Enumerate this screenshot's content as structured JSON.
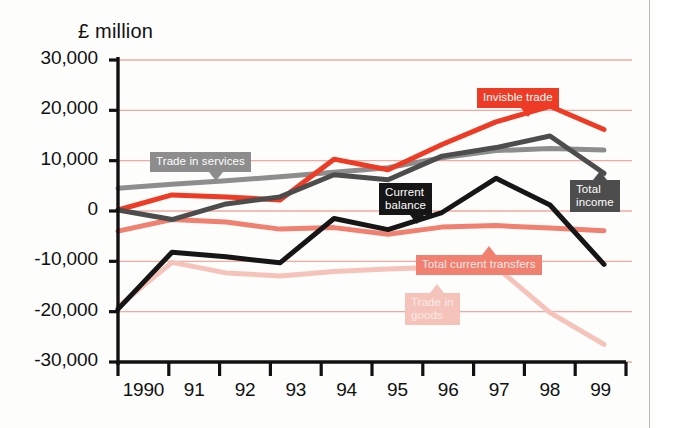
{
  "chart_data": {
    "type": "line",
    "title": "",
    "subtitle": "",
    "ylabel": "£ million",
    "xlabel": "",
    "grid": true,
    "legend_position": "inline-labels",
    "ylim": [
      -30000,
      30000
    ],
    "ytick_labels": [
      "30,000",
      "20,000",
      "10,000",
      "0",
      "-10,000",
      "-20,000",
      "-30,000"
    ],
    "ytick_values": [
      30000,
      20000,
      10000,
      0,
      -10000,
      -20000,
      -30000
    ],
    "categories": [
      "1990",
      "91",
      "92",
      "93",
      "94",
      "95",
      "96",
      "97",
      "98",
      "99"
    ],
    "x": [
      1990,
      1991,
      1992,
      1993,
      1994,
      1995,
      1996,
      1997,
      1998,
      1999
    ],
    "series": [
      {
        "name": "Invisble trade",
        "color": "#ee3b25",
        "width": 5,
        "values": [
          200,
          3200,
          2800,
          2200,
          10300,
          8200,
          13200,
          17700,
          20800,
          16200
        ]
      },
      {
        "name": "Trade in services",
        "color": "#8d8d8d",
        "width": 5,
        "values": [
          4500,
          5300,
          6000,
          6800,
          7700,
          8600,
          10600,
          12000,
          12400,
          12100
        ]
      },
      {
        "name": "Total income",
        "color": "#4d4d4d",
        "width": 5,
        "values": [
          200,
          -1700,
          1400,
          2800,
          7200,
          6200,
          10900,
          12600,
          14900,
          7500
        ]
      },
      {
        "name": "Current balance",
        "color": "#161616",
        "width": 5,
        "values": [
          -19500,
          -8200,
          -9100,
          -10300,
          -1500,
          -3700,
          -300,
          6500,
          1200,
          -10600
        ]
      },
      {
        "name": "Total current transfers",
        "color": "#f08070",
        "width": 5,
        "values": [
          -4000,
          -1700,
          -2200,
          -3600,
          -3300,
          -4600,
          -3200,
          -2900,
          -3400,
          -3900
        ]
      },
      {
        "name": "Trade in goods",
        "color": "#f6c3bb",
        "width": 5,
        "values": [
          -19000,
          -10200,
          -12300,
          -12900,
          -12000,
          -11500,
          -11200,
          -11100,
          -20200,
          -26500
        ]
      }
    ],
    "annotations": [
      {
        "id": "trade-in-services-label",
        "text": "Trade in services",
        "bg": "#8d8d8d",
        "color": "#ffffff",
        "x": 150,
        "y": 152,
        "arrow_x": 59,
        "arrow_dir": "down"
      },
      {
        "id": "invisble-trade-label",
        "text": "Invisble trade",
        "bg": "#ee3b25",
        "color": "#ffffff",
        "x": 477,
        "y": 88,
        "arrow_x": 44,
        "arrow_dir": "down"
      },
      {
        "id": "current-balance-label",
        "text": "Current\nbalance",
        "bg": "#161616",
        "color": "#ffffff",
        "x": 379,
        "y": 183,
        "arrow_x": 31,
        "arrow_dir": "down"
      },
      {
        "id": "total-income-label",
        "text": "Total\nincome",
        "bg": "#4d4d4d",
        "color": "#ffffff",
        "x": 570,
        "y": 180,
        "arrow_x": 23,
        "arrow_dir": "up"
      },
      {
        "id": "total-current-transfers-label",
        "text": "Total current transfers",
        "bg": "#f08070",
        "color": "#fdeae7",
        "x": 416,
        "y": 255,
        "arrow_x": 66,
        "arrow_dir": "up"
      },
      {
        "id": "trade-in-goods-label",
        "text": "Trade in\ngoods",
        "bg": "#f6c3bb",
        "color": "#fdeae7",
        "x": 405,
        "y": 293,
        "arrow_x": 25,
        "arrow_dir": "up"
      }
    ],
    "gridline_color": "#f4a9a0",
    "axis_color": "#111111",
    "background": "#fdfdfc"
  }
}
